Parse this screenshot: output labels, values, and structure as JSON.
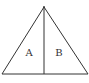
{
  "diagram": {
    "type": "triangle-split",
    "stroke_color": "#333333",
    "background": "#ffffff",
    "apex": [
      44,
      7
    ],
    "base_left": [
      2,
      74
    ],
    "base_right": [
      88,
      74
    ],
    "divider": {
      "from": [
        44,
        7
      ],
      "to": [
        44,
        74
      ]
    },
    "regions": [
      {
        "label": "A",
        "position": [
          29,
          56
        ]
      },
      {
        "label": "B",
        "position": [
          59,
          56
        ]
      }
    ]
  }
}
